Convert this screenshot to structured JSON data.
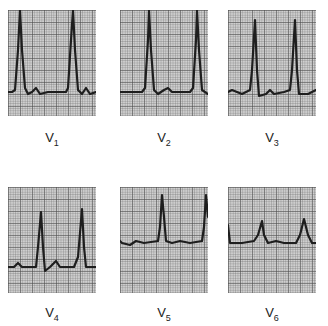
{
  "figure": {
    "leads": [
      {
        "name": "V",
        "sub": "1",
        "x": 8,
        "y": 10,
        "label_y": 130,
        "trace": "M0,82 L4,82 L7,80 L10,40 L12,0 L14,40 L17,78 L20,84 L24,82 L28,78 L32,84 L40,82 L58,82 L60,78 L63,30 L65,0 L67,40 L70,80 L74,84 L78,78 L82,84 L88,82"
      },
      {
        "name": "V",
        "sub": "2",
        "x": 120,
        "y": 10,
        "label_y": 130,
        "trace": "M0,82 L22,82 L25,78 L28,30 L29,0 L31,40 L34,80 L38,84 L44,80 L48,78 L52,82 L70,82 L73,78 L76,30 L77,0 L79,40 L82,80 L88,84"
      },
      {
        "name": "V",
        "sub": "3",
        "x": 228,
        "y": 10,
        "label_y": 130,
        "trace": "M0,82 L4,80 L14,84 L22,80 L24,60 L27,10 L29,60 L31,86 L38,84 L42,80 L46,84 L56,82 L62,80 L64,60 L67,10 L69,60 L71,84 L80,84 L88,80"
      },
      {
        "name": "V",
        "sub": "4",
        "x": 8,
        "y": 187,
        "label_y": 305,
        "trace": "M0,80 L6,80 L10,76 L14,80 L28,80 L30,60 L33,25 L35,60 L37,84 L42,80 L48,74 L52,80 L66,80 L70,70 L74,22 L76,60 L78,80 L88,80"
      },
      {
        "name": "V",
        "sub": "5",
        "x": 120,
        "y": 187,
        "label_y": 305,
        "trace": "M0,54 L2,56 L10,58 L16,54 L24,56 L38,54 L40,40 L42,8 L44,30 L46,54 L52,56 L60,54 L70,56 L82,54 L84,40 L86,8 L88,30"
      },
      {
        "name": "V",
        "sub": "6",
        "x": 228,
        "y": 187,
        "label_y": 305,
        "trace": "M0,38 L2,56 L14,56 L26,54 L30,48 L34,34 L36,48 L40,56 L48,54 L56,56 L68,56 L72,48 L76,32 L80,48 L84,56 L88,56"
      }
    ]
  }
}
